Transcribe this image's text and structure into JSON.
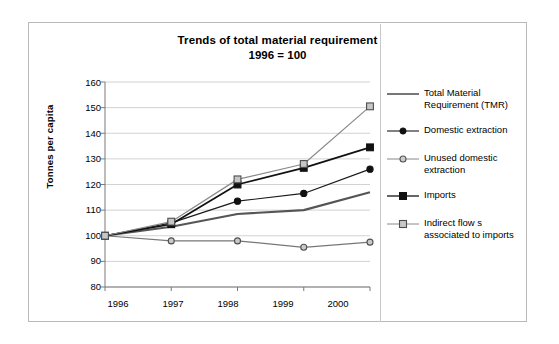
{
  "chart_data": {
    "type": "line",
    "title": "Trends of total material requirement",
    "subtitle": "1996 = 100",
    "xlabel": "",
    "ylabel": "Tonnes per capita",
    "categories": [
      "1996",
      "1997",
      "1998",
      "1999",
      "2000"
    ],
    "x": [
      1996,
      1997,
      1998,
      1999,
      2000
    ],
    "ylim": [
      80,
      160
    ],
    "yticks": [
      80,
      90,
      100,
      110,
      120,
      130,
      140,
      150,
      160
    ],
    "grid": true,
    "legend_position": "right",
    "series": [
      {
        "name": "Total Material Requirement (TMR)",
        "marker": "none",
        "color": "#555555",
        "values": [
          100,
          103.5,
          108.5,
          110,
          117
        ]
      },
      {
        "name": "Domestic extraction",
        "marker": "filled-circle",
        "color": "#1a1a1a",
        "values": [
          100,
          105,
          113.5,
          116.5,
          126
        ]
      },
      {
        "name": "Unused domestic extraction",
        "marker": "open-circle",
        "color": "#777777",
        "values": [
          100,
          98,
          98,
          95.5,
          97.5
        ]
      },
      {
        "name": "Imports",
        "marker": "filled-square",
        "color": "#111111",
        "values": [
          100,
          104.5,
          120,
          126.5,
          134.5
        ]
      },
      {
        "name": "Indirect flows associated to imports",
        "marker": "open-square",
        "color": "#8a8a8a",
        "values": [
          100,
          105.5,
          122,
          128,
          150.5
        ]
      }
    ],
    "legend_entries": [
      {
        "label_line1": "Total Material",
        "label_line2": "Requirement (TMR)"
      },
      {
        "label_line1": "Domestic extraction",
        "label_line2": ""
      },
      {
        "label_line1": "Unused domestic",
        "label_line2": "extraction"
      },
      {
        "label_line1": "Imports",
        "label_line2": ""
      },
      {
        "label_line1": "Indirect flow s",
        "label_line2": "associated to imports"
      }
    ]
  }
}
